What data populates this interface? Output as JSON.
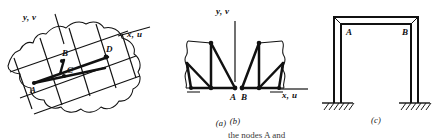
{
  "figure": {
    "panels": [
      {
        "id": "a",
        "caption": "(a)",
        "description": "quadrilateral finite element mesh over an irregular two-dimensional body",
        "axis_labels": {
          "vertical": "y, v",
          "horizontal": "x, u"
        },
        "node_labels": [
          "A",
          "B",
          "C",
          "D"
        ]
      },
      {
        "id": "b",
        "caption": "(b)",
        "description": "two separated triangular finite element meshes meeting at the horizontal axis",
        "axis_labels": {
          "vertical": "y, v",
          "horizontal": "x, u"
        },
        "node_labels": [
          "A",
          "B"
        ]
      },
      {
        "id": "c",
        "caption": "(c)",
        "description": "portal frame with fixed supports showing undeformed and deformed outlines",
        "axis_labels": {
          "vertical": "",
          "horizontal": ""
        },
        "node_labels": [
          "A",
          "B"
        ]
      }
    ],
    "colors": {
      "ink": "#111111",
      "background": "#ffffff",
      "hatch": "#1a1a1a"
    },
    "truncated_bottom_text": "the nodes A and"
  }
}
